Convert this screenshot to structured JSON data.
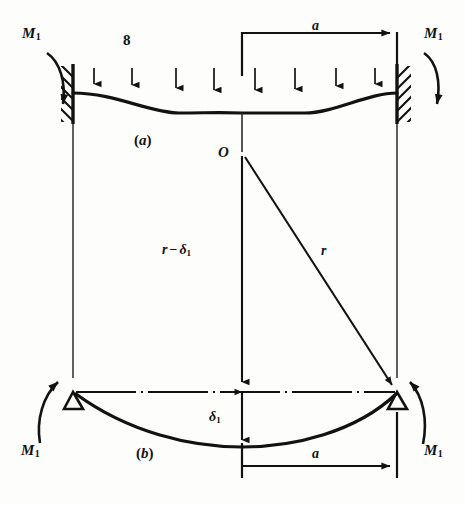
{
  "figure": {
    "parts": [
      {
        "id": "part-a",
        "label": "(a)"
      },
      {
        "id": "part-b",
        "label": "(b)"
      }
    ],
    "upper": {
      "caption": "(a)",
      "load_label": "8",
      "end_moment_left": {
        "symbol": "M",
        "subscript": "1"
      },
      "end_moment_right": {
        "symbol": "M",
        "subscript": "1"
      },
      "span_dimension_label": "a",
      "support_type": "fixed-hatched-wall",
      "load_arrow_count": 8
    },
    "lower": {
      "caption": "(b)",
      "center_point_label": "O",
      "radius_label": "r",
      "radius_minus_delta_label": {
        "prefix": "r",
        "minus": "−",
        "delta": "δ",
        "subscript": "1"
      },
      "deflection_label": {
        "delta": "δ",
        "subscript": "1"
      },
      "end_moment_left": {
        "symbol": "M",
        "subscript": "1"
      },
      "end_moment_right": {
        "symbol": "M",
        "subscript": "1"
      },
      "span_dimension_label": "a",
      "support_type": "pinned-triangle"
    },
    "colors": {
      "ink": "#121212",
      "paper": "#fdfdfc",
      "thin_line": "#2b2b2b"
    }
  }
}
